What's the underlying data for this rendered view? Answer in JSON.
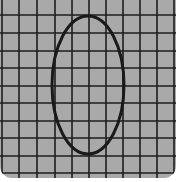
{
  "image": {
    "description": "Grid paper with a hand-drawn vertical ellipse",
    "background_color": "#a9a9a9",
    "grid_line_color": "#1e1e1e",
    "ellipse_stroke_color": "#1a1a1a"
  },
  "grid": {
    "vertical_lines_x": [
      2,
      19,
      37,
      55,
      72,
      89,
      106,
      123,
      140,
      157,
      174
    ],
    "horizontal_lines_y": [
      15,
      33,
      51,
      68,
      86,
      103,
      121,
      138,
      156,
      173
    ]
  },
  "ellipse": {
    "cx": 88,
    "cy": 85,
    "rx": 36,
    "ry": 69
  }
}
